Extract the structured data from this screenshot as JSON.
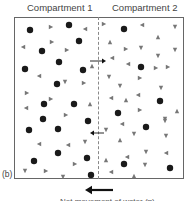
{
  "diagram": {
    "headers": [
      "Compartment 1",
      "Compartment 2"
    ],
    "panel_label": "(b)",
    "bottom_caption": "Net movement of water (≈)",
    "colors": {
      "border": "#666666",
      "divider": "#888888",
      "solute_dot": "#1a1a1a",
      "water_triangle": "#777777",
      "arrow": "#111111"
    },
    "legend_semantics": {
      "dots": "large solute particles (impermeant)",
      "triangles": "small particles (permeant)"
    },
    "membrane_arrows": [
      {
        "x1": 90,
        "y1": 61,
        "x2": 106,
        "y2": 61,
        "direction": "right"
      },
      {
        "x1": 104,
        "y1": 133,
        "x2": 90,
        "y2": 133,
        "direction": "left"
      }
    ],
    "net_arrow": {
      "x1": 113,
      "y1": 190,
      "x2": 85,
      "y2": 190,
      "direction": "left"
    },
    "dots": [
      [
        30,
        30
      ],
      [
        69,
        25
      ],
      [
        79,
        41
      ],
      [
        42,
        51
      ],
      [
        59,
        62
      ],
      [
        25,
        69
      ],
      [
        83,
        70
      ],
      [
        57,
        84
      ],
      [
        44,
        104
      ],
      [
        74,
        104
      ],
      [
        43,
        119
      ],
      [
        88,
        121
      ],
      [
        29,
        130
      ],
      [
        58,
        129
      ],
      [
        58,
        153
      ],
      [
        34,
        161
      ],
      [
        87,
        158
      ],
      [
        91,
        175
      ],
      [
        124,
        29
      ],
      [
        141,
        67
      ],
      [
        160,
        101
      ],
      [
        118,
        113
      ],
      [
        146,
        127
      ],
      [
        124,
        164
      ],
      [
        170,
        168
      ]
    ],
    "triangles": [
      [
        51,
        27,
        "r"
      ],
      [
        85,
        29,
        "l"
      ],
      [
        23,
        47,
        "l"
      ],
      [
        52,
        42,
        "r"
      ],
      [
        67,
        50,
        "r"
      ],
      [
        92,
        66,
        "u"
      ],
      [
        39,
        76,
        "l"
      ],
      [
        65,
        82,
        "d"
      ],
      [
        84,
        83,
        "r"
      ],
      [
        27,
        93,
        "r"
      ],
      [
        51,
        99,
        "r"
      ],
      [
        90,
        104,
        "u"
      ],
      [
        26,
        108,
        "l"
      ],
      [
        66,
        115,
        "r"
      ],
      [
        39,
        144,
        "l"
      ],
      [
        68,
        145,
        "l"
      ],
      [
        85,
        142,
        "d"
      ],
      [
        25,
        171,
        "d"
      ],
      [
        46,
        171,
        "r"
      ],
      [
        63,
        177,
        "d"
      ],
      [
        75,
        164,
        "r"
      ],
      [
        104,
        24,
        "r"
      ],
      [
        142,
        25,
        "l"
      ],
      [
        175,
        27,
        "d"
      ],
      [
        110,
        42,
        "u"
      ],
      [
        158,
        37,
        "u"
      ],
      [
        126,
        49,
        "r"
      ],
      [
        141,
        48,
        "d"
      ],
      [
        158,
        56,
        "d"
      ],
      [
        175,
        50,
        "d"
      ],
      [
        112,
        58,
        "l"
      ],
      [
        128,
        64,
        "l"
      ],
      [
        156,
        68,
        "r"
      ],
      [
        168,
        67,
        "r"
      ],
      [
        109,
        77,
        "d"
      ],
      [
        140,
        78,
        "r"
      ],
      [
        120,
        86,
        "d"
      ],
      [
        161,
        88,
        "d"
      ],
      [
        111,
        98,
        "l"
      ],
      [
        126,
        100,
        "u"
      ],
      [
        138,
        95,
        "l"
      ],
      [
        140,
        110,
        "r"
      ],
      [
        177,
        111,
        "u"
      ],
      [
        165,
        119,
        "d"
      ],
      [
        122,
        124,
        "l"
      ],
      [
        165,
        121,
        "d"
      ],
      [
        106,
        130,
        "d"
      ],
      [
        134,
        134,
        "d"
      ],
      [
        166,
        136,
        "d"
      ],
      [
        120,
        140,
        "u"
      ],
      [
        146,
        152,
        "d"
      ],
      [
        166,
        153,
        "l"
      ],
      [
        106,
        160,
        "u"
      ],
      [
        127,
        157,
        "l"
      ],
      [
        145,
        165,
        "d"
      ],
      [
        111,
        172,
        "l"
      ],
      [
        134,
        176,
        "u"
      ]
    ]
  }
}
